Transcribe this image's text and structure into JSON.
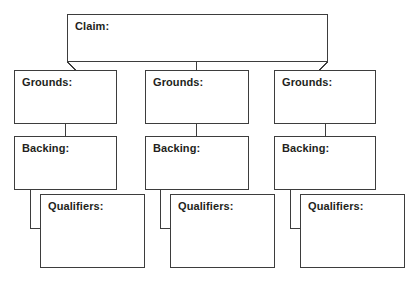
{
  "diagram": {
    "background_color": "#ffffff",
    "border_color": "#3d3d3d",
    "text_color": "#231f20",
    "claim": {
      "label": "Claim:",
      "value": ""
    },
    "columns": [
      {
        "grounds": {
          "label": "Grounds:",
          "value": ""
        },
        "backing": {
          "label": "Backing:",
          "value": ""
        },
        "qualifiers": {
          "label": "Qualifiers:",
          "value": ""
        }
      },
      {
        "grounds": {
          "label": "Grounds:",
          "value": ""
        },
        "backing": {
          "label": "Backing:",
          "value": ""
        },
        "qualifiers": {
          "label": "Qualifiers:",
          "value": ""
        }
      },
      {
        "grounds": {
          "label": "Grounds:",
          "value": ""
        },
        "backing": {
          "label": "Backing:",
          "value": ""
        },
        "qualifiers": {
          "label": "Qualifiers:",
          "value": ""
        }
      }
    ]
  }
}
